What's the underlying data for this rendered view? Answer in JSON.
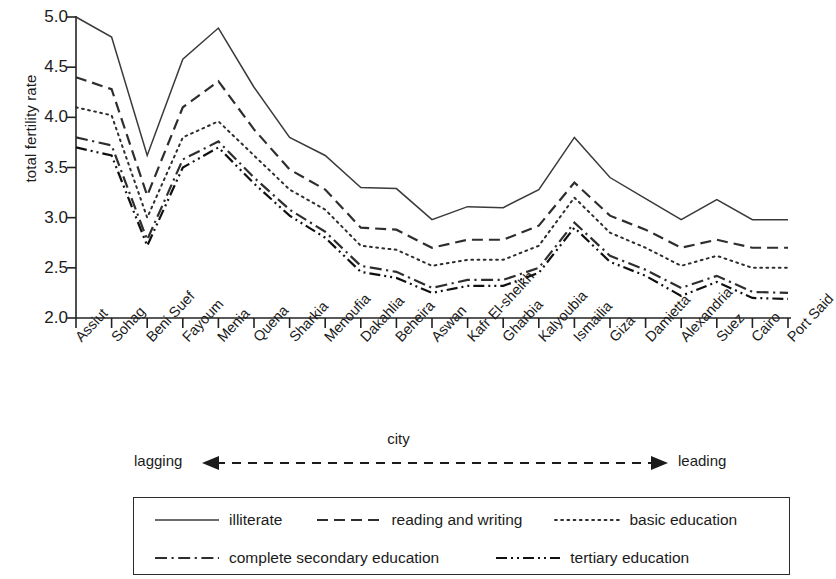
{
  "chart_data": {
    "type": "line",
    "title": "",
    "xlabel": "city",
    "ylabel": "total fertility rate",
    "ylim": [
      2.0,
      5.0
    ],
    "yticks": [
      "2.0",
      "2.5",
      "3.0",
      "3.5",
      "4.0",
      "4.5",
      "5.0"
    ],
    "grid": false,
    "legend_position": "bottom",
    "categories": [
      "Assiut",
      "Sohag",
      "Beni Suef",
      "Fayoum",
      "Menia",
      "Quena",
      "Sharkia",
      "Menoufia",
      "Dakahlia",
      "Beheira",
      "Aswan",
      "Kafr El-sheikh",
      "Gharbia",
      "Kalyoubia",
      "Ismailia",
      "Giza",
      "Damietta",
      "Alexandria",
      "Suez",
      "Cairo",
      "Port Said"
    ],
    "series": [
      {
        "name": "illiterate",
        "style": "solid",
        "values": [
          5.0,
          4.8,
          3.62,
          4.58,
          4.89,
          4.3,
          3.8,
          3.62,
          3.3,
          3.29,
          2.98,
          3.11,
          3.1,
          3.28,
          3.8,
          3.4,
          3.19,
          2.98,
          3.18,
          2.98,
          2.98
        ]
      },
      {
        "name": "reading and writing",
        "style": "dashed",
        "values": [
          4.4,
          4.28,
          3.22,
          4.1,
          4.36,
          3.88,
          3.48,
          3.28,
          2.9,
          2.88,
          2.7,
          2.78,
          2.78,
          2.92,
          3.35,
          3.02,
          2.88,
          2.7,
          2.78,
          2.7,
          2.7
        ]
      },
      {
        "name": "basic education",
        "style": "dotted",
        "values": [
          4.1,
          4.02,
          3.0,
          3.8,
          3.96,
          3.62,
          3.28,
          3.08,
          2.72,
          2.68,
          2.52,
          2.58,
          2.58,
          2.72,
          3.2,
          2.85,
          2.7,
          2.52,
          2.62,
          2.5,
          2.5
        ]
      },
      {
        "name": "complete secondary education",
        "style": "dashdot",
        "values": [
          3.8,
          3.72,
          2.78,
          3.58,
          3.76,
          3.4,
          3.08,
          2.86,
          2.52,
          2.46,
          2.3,
          2.38,
          2.38,
          2.5,
          2.95,
          2.62,
          2.48,
          2.3,
          2.42,
          2.26,
          2.25
        ]
      },
      {
        "name": "tertiary education",
        "style": "dashdotdot",
        "values": [
          3.7,
          3.62,
          2.72,
          3.5,
          3.7,
          3.34,
          3.02,
          2.8,
          2.46,
          2.4,
          2.25,
          2.32,
          2.32,
          2.45,
          2.9,
          2.56,
          2.42,
          2.22,
          2.36,
          2.2,
          2.19
        ]
      }
    ]
  },
  "axis": {
    "y_label": "total fertility rate",
    "x_label": "city",
    "lagging_label": "lagging",
    "leading_label": "leading",
    "arrow_left_icon": "arrow-left-icon",
    "arrow_right_icon": "arrow-right-icon"
  },
  "legend": {
    "rows": [
      [
        {
          "label": "illiterate",
          "style": "solid"
        },
        {
          "label": "reading and writing",
          "style": "dashed"
        },
        {
          "label": "basic education",
          "style": "dotted"
        }
      ],
      [
        {
          "label": "complete secondary education",
          "style": "dashdot"
        },
        {
          "label": "tertiary education",
          "style": "dashdotdot"
        }
      ]
    ]
  },
  "colors": {
    "line": "#3a3a3a",
    "line_dark": "#101010",
    "axis": "#222222",
    "text": "#1b1b1b",
    "background": "#ffffff"
  }
}
